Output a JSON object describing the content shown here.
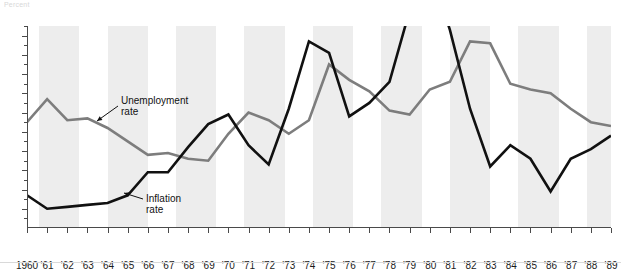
{
  "top_label": "Percent",
  "chart_data": {
    "type": "line",
    "title": "",
    "subtitle": "",
    "xlabel": "",
    "ylabel": "Percent",
    "grid": false,
    "legend_position": "inline-annotations",
    "x": [
      1960,
      1961,
      1962,
      1963,
      1964,
      1965,
      1966,
      1967,
      1968,
      1969,
      1970,
      1971,
      1972,
      1973,
      1974,
      1975,
      1976,
      1977,
      1978,
      1979,
      1980,
      1981,
      1982,
      1983,
      1984,
      1985,
      1986,
      1987,
      1988,
      1989
    ],
    "tick_labels": [
      "1960",
      "'61",
      "'62",
      "'63",
      "'64",
      "'65",
      "'66",
      "'67",
      "'68",
      "'69",
      "'70",
      "'71",
      "'72",
      "'73",
      "'74",
      "'75",
      "'76",
      "'77",
      "'78",
      "'79",
      "'80",
      "'81",
      "'82",
      "'83",
      "'84",
      "'85",
      "'86",
      "'87",
      "'88",
      "'89"
    ],
    "xlim": [
      1960,
      1989
    ],
    "ylim": [
      0,
      10.5
    ],
    "ytick_values": [
      1,
      2,
      3,
      4,
      5,
      6,
      7,
      8,
      9,
      10
    ],
    "ytick_labels": [
      "1",
      "2",
      "3",
      "4",
      "5",
      "6",
      "7",
      "8",
      "9",
      "10"
    ],
    "series": [
      {
        "name": "Unemployment rate",
        "color": "#7d7d7d",
        "values": [
          5.5,
          6.7,
          5.6,
          5.7,
          5.2,
          4.5,
          3.8,
          3.9,
          3.6,
          3.5,
          4.9,
          6.0,
          5.6,
          4.9,
          5.6,
          8.5,
          7.7,
          7.1,
          6.1,
          5.9,
          7.2,
          7.6,
          9.7,
          9.6,
          7.5,
          7.2,
          7.0,
          6.2,
          5.5,
          5.3
        ]
      },
      {
        "name": "Inflation rate",
        "color": "#111111",
        "values": [
          1.7,
          1.0,
          1.1,
          1.2,
          1.3,
          1.7,
          2.9,
          2.9,
          4.2,
          5.4,
          5.9,
          4.3,
          3.3,
          6.2,
          9.7,
          9.1,
          5.8,
          6.5,
          7.6,
          11.3,
          13.5,
          10.3,
          6.2,
          3.2,
          4.3,
          3.6,
          1.9,
          3.6,
          4.1,
          4.8
        ]
      }
    ],
    "annotations": [
      {
        "label_line1": "Unemployment",
        "label_line2": "rate",
        "series": "Unemployment rate"
      },
      {
        "label_line1": "Inflation",
        "label_line2": "rate",
        "series": "Inflation rate"
      }
    ],
    "shaded_bands": [
      [
        1960.6,
        1962.6
      ],
      [
        1964.0,
        1966.0
      ],
      [
        1967.4,
        1969.4
      ],
      [
        1970.8,
        1972.8
      ],
      [
        1974.2,
        1976.2
      ],
      [
        1977.6,
        1979.6
      ],
      [
        1981.0,
        1983.0
      ],
      [
        1984.4,
        1986.4
      ],
      [
        1987.8,
        1989.0
      ]
    ]
  }
}
